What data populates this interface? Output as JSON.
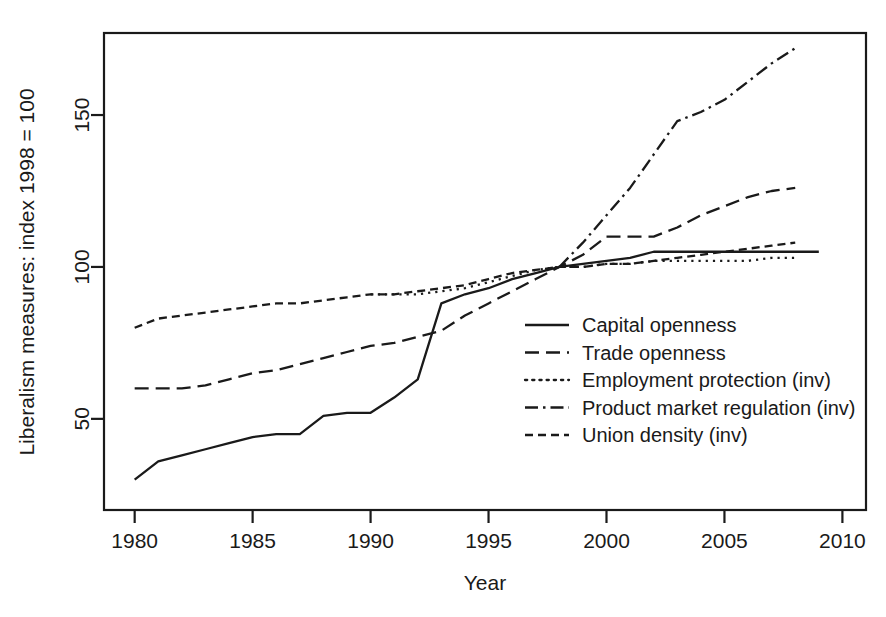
{
  "chart_data": {
    "type": "line",
    "title": "",
    "xlabel": "Year",
    "ylabel": "Liberalism measures: index 1998 = 100",
    "xlim": [
      1978.7,
      2011.0
    ],
    "ylim": [
      20.0,
      177.0
    ],
    "xticks": [
      1980,
      1985,
      1990,
      1995,
      2000,
      2005,
      2010
    ],
    "xtick_labels": [
      "1980",
      "1985",
      "1990",
      "1995",
      "2000",
      "2005",
      "2010"
    ],
    "yticks": [
      50,
      100,
      150
    ],
    "ytick_labels": [
      "50",
      "100",
      "150"
    ],
    "grid": false,
    "legend_position": "center-right-inside",
    "frame": true,
    "series": [
      {
        "name": "Capital openness",
        "dash_style": "solid",
        "x": [
          1980,
          1981,
          1982,
          1983,
          1984,
          1985,
          1986,
          1987,
          1988,
          1989,
          1990,
          1991,
          1992,
          1993,
          1994,
          1995,
          1996,
          1997,
          1998,
          1999,
          2000,
          2001,
          2002,
          2003,
          2004,
          2005,
          2006,
          2007,
          2008,
          2009
        ],
        "values": [
          30,
          36,
          38,
          40,
          42,
          44,
          45,
          45,
          51,
          52,
          52,
          57,
          63,
          88,
          91,
          93,
          96,
          98,
          100,
          101,
          102,
          103,
          105,
          105,
          105,
          105,
          105,
          105,
          105,
          105
        ]
      },
      {
        "name": "Trade openness",
        "dash_style": "long-dash",
        "x": [
          1980,
          1981,
          1982,
          1983,
          1984,
          1985,
          1986,
          1987,
          1988,
          1989,
          1990,
          1991,
          1992,
          1993,
          1994,
          1995,
          1996,
          1997,
          1998,
          1999,
          2000,
          2001,
          2002,
          2003,
          2004,
          2005,
          2006,
          2007,
          2008
        ],
        "values": [
          60,
          60,
          60,
          61,
          63,
          65,
          66,
          68,
          70,
          72,
          74,
          75,
          77,
          79,
          84,
          88,
          92,
          96,
          100,
          104,
          110,
          110,
          110,
          113,
          117,
          120,
          123,
          125,
          126
        ]
      },
      {
        "name": "Employment protection (inv)",
        "dash_style": "dotted",
        "x": [
          1990,
          1991,
          1992,
          1993,
          1994,
          1995,
          1996,
          1997,
          1998,
          1999,
          2000,
          2001,
          2002,
          2003,
          2004,
          2005,
          2006,
          2007,
          2008
        ],
        "values": [
          91,
          91,
          91,
          92,
          93,
          95,
          97,
          99,
          100,
          100,
          101,
          101,
          102,
          102,
          102,
          102,
          102,
          103,
          103
        ]
      },
      {
        "name": "Product market regulation (inv)",
        "dash_style": "dash-dot",
        "x": [
          1998,
          1999,
          2000,
          2001,
          2002,
          2003,
          2004,
          2005,
          2006,
          2007,
          2008
        ],
        "values": [
          100,
          108,
          117,
          126,
          137,
          148,
          151,
          155,
          161,
          167,
          172
        ]
      },
      {
        "name": "Union density (inv)",
        "dash_style": "short-dash",
        "x": [
          1980,
          1981,
          1982,
          1983,
          1984,
          1985,
          1986,
          1987,
          1988,
          1989,
          1990,
          1991,
          1992,
          1993,
          1994,
          1995,
          1996,
          1997,
          1998,
          1999,
          2000,
          2001,
          2002,
          2003,
          2004,
          2005,
          2006,
          2007,
          2008
        ],
        "values": [
          80,
          83,
          84,
          85,
          86,
          87,
          88,
          88,
          89,
          90,
          91,
          91,
          92,
          93,
          94,
          96,
          98,
          99,
          100,
          100,
          101,
          101,
          102,
          103,
          104,
          105,
          106,
          107,
          108
        ]
      }
    ],
    "legend_entries": [
      "Capital openness",
      "Trade openness",
      "Employment protection (inv)",
      "Product market regulation (inv)",
      "Union density (inv)"
    ]
  }
}
